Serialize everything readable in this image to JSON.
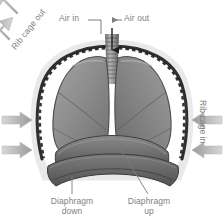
{
  "figure": {
    "type": "anatomical-diagram",
    "background_color": "#ffffff",
    "label_color": "#808080",
    "arrow_color": "#a8a8a8",
    "lung_color": "#8c8c8c",
    "ribcage_color": "#3a3a3a",
    "diaphragm_color": "#6f6f6f"
  },
  "labels": {
    "air_in": "Air in",
    "air_out": "Air out",
    "rib_cage_out": "Rib cage out",
    "rib_cage_in": "Rib cage in",
    "diaphragm_down_line1": "Diaphragm",
    "diaphragm_down_line2": "down",
    "diaphragm_up_line1": "Diaphragm",
    "diaphragm_up_line2": "up"
  },
  "parts": {
    "trachea": "trachea",
    "left_lung": "left-lung",
    "right_lung": "right-lung",
    "rib_cage": "rib-cage",
    "diaphragm_up": "diaphragm-up-curve",
    "diaphragm_down": "diaphragm-down-curve"
  },
  "arrows": {
    "air_in_direction": "down",
    "air_out_direction": "left",
    "rib_cage_out_count": 4,
    "rib_cage_in_count": 4
  }
}
